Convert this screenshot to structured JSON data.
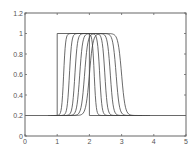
{
  "chart_data": {
    "type": "line",
    "title": "",
    "xlabel": "",
    "ylabel": "",
    "xlim": [
      0,
      5
    ],
    "ylim": [
      0,
      1.2
    ],
    "grid": false,
    "legend": null,
    "x_ticks": [
      0,
      1,
      2,
      3,
      4,
      5
    ],
    "x_tick_labels": [
      "0",
      "1",
      "2",
      "3",
      "4",
      "5"
    ],
    "y_ticks": [
      0,
      0.2,
      0.4,
      0.6,
      0.8,
      1,
      1.2
    ],
    "y_tick_labels": [
      "0",
      "0.2",
      "0.4",
      "0.6",
      "0.8",
      "1",
      "1.2"
    ],
    "baseline": 0.2,
    "peak": 1.0,
    "series": [
      {
        "name": "pulse-0",
        "shape": "rectangular",
        "rise_x": 1.0,
        "fall_x": 2.0,
        "smoothing": 0.0
      },
      {
        "name": "pulse-1",
        "shape": "smooth",
        "rise_x": 1.2,
        "fall_x": 2.15,
        "smoothing": 0.12
      },
      {
        "name": "pulse-2",
        "shape": "smooth",
        "rise_x": 1.38,
        "fall_x": 2.32,
        "smoothing": 0.14
      },
      {
        "name": "pulse-3",
        "shape": "smooth",
        "rise_x": 1.55,
        "fall_x": 2.48,
        "smoothing": 0.16
      },
      {
        "name": "pulse-4",
        "shape": "smooth",
        "rise_x": 1.7,
        "fall_x": 2.65,
        "smoothing": 0.18
      },
      {
        "name": "pulse-5",
        "shape": "smooth",
        "rise_x": 1.85,
        "fall_x": 2.83,
        "smoothing": 0.2
      },
      {
        "name": "pulse-6",
        "shape": "smooth",
        "rise_x": 2.0,
        "fall_x": 3.0,
        "smoothing": 0.22
      }
    ],
    "baseline_segments": [
      {
        "name": "left-baseline",
        "from_x": 0,
        "to_x": 1.0,
        "y": 0.2
      },
      {
        "name": "right-baseline",
        "from_x": 2.0,
        "to_x": 5,
        "y": 0.2
      }
    ]
  },
  "layout": {
    "plot_left": 25,
    "plot_right": 186,
    "plot_top": 13,
    "plot_bottom": 136
  }
}
